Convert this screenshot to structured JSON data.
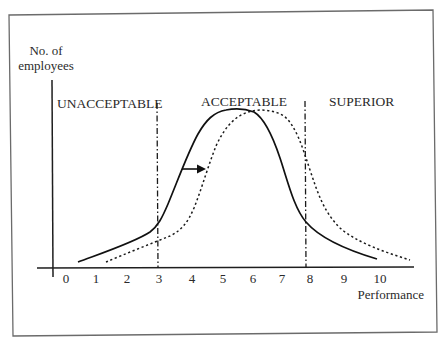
{
  "diagram": {
    "y_axis_label_line1": "No. of",
    "y_axis_label_line2": "employees",
    "x_axis_label": "Performance",
    "regions": {
      "unacceptable": "UNACCEPTABLE",
      "acceptable": "ACCEPTABLE",
      "superior": "SUPERIOR"
    },
    "x_ticks": [
      "0",
      "1",
      "2",
      "3",
      "4",
      "5",
      "6",
      "7",
      "8",
      "9",
      "10"
    ],
    "boundaries": {
      "lower": "3",
      "upper": "8"
    },
    "curves": [
      {
        "name": "current distribution",
        "style": "solid",
        "peak_at": 5
      },
      {
        "name": "shifted distribution",
        "style": "dotted",
        "peak_at": 6
      }
    ],
    "arrow": {
      "direction": "right",
      "meaning": "shift of performance distribution"
    }
  }
}
